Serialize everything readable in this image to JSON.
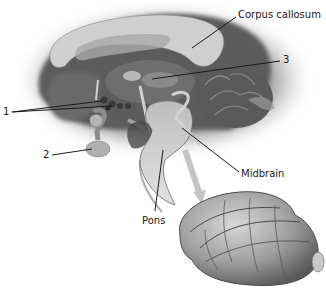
{
  "diagram": {
    "type": "anatomical-illustration",
    "labels": [
      {
        "id": "corpus-callosum",
        "text": "Corpus callosum",
        "x": 238,
        "y": 14
      },
      {
        "id": "num-3",
        "text": "3",
        "x": 284,
        "y": 57
      },
      {
        "id": "num-1",
        "text": "1",
        "x": 3,
        "y": 108
      },
      {
        "id": "num-2",
        "text": "2",
        "x": 43,
        "y": 151
      },
      {
        "id": "midbrain",
        "text": "Midbrain",
        "x": 241,
        "y": 169
      },
      {
        "id": "pons",
        "text": "Pons",
        "x": 142,
        "y": 216
      }
    ],
    "colors": {
      "background": "#ffffff",
      "tissue_light": "#c9c9c9",
      "tissue_mid": "#9a9a9a",
      "tissue_dark": "#4a4a4a",
      "shadow": "#2e2e2e",
      "leader_line": "#1a1a1a"
    }
  }
}
